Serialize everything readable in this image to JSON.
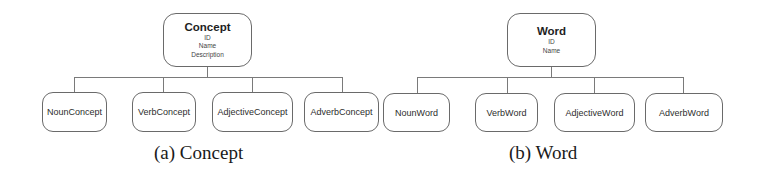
{
  "diagrams": [
    {
      "root": {
        "title": "Concept",
        "attributes": [
          "ID",
          "Name",
          "Description"
        ]
      },
      "children": [
        "NounConcept",
        "VerbConcept",
        "AdjectiveConcept",
        "AdverbConcept"
      ],
      "caption": "(a) Concept"
    },
    {
      "root": {
        "title": "Word",
        "attributes": [
          "ID",
          "Name"
        ]
      },
      "children": [
        "NounWord",
        "VerbWord",
        "AdjectiveWord",
        "AdverbWord"
      ],
      "caption": "(b) Word"
    }
  ]
}
